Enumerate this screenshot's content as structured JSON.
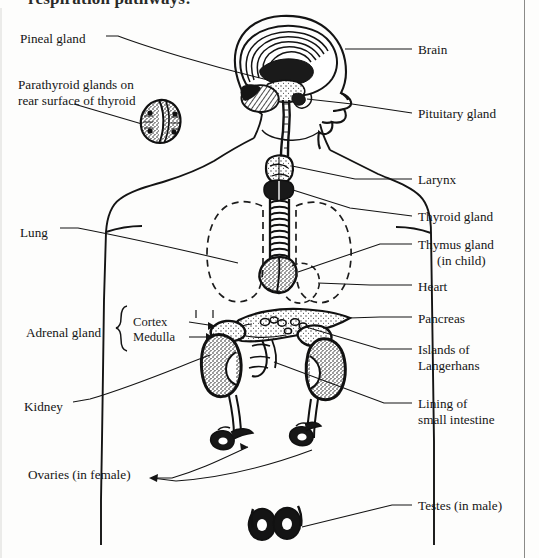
{
  "page": {
    "heading_clipped": "respiration pathways:",
    "background": "#fdfdfc",
    "ink": "#151515",
    "width": 539,
    "height": 558
  },
  "labels": {
    "left": [
      {
        "id": "pineal-gland",
        "text": "Pineal gland",
        "x": 20,
        "y": 31
      },
      {
        "id": "parathyroid-glands",
        "text": "Parathyroid glands on",
        "text2": "rear surface of thyroid",
        "x": 18,
        "y": 77
      },
      {
        "id": "lung",
        "text": "Lung",
        "x": 20,
        "y": 225
      },
      {
        "id": "adrenal-gland",
        "text": "Adrenal gland",
        "x": 26,
        "y": 325
      },
      {
        "id": "kidney",
        "text": "Kidney",
        "x": 24,
        "y": 399
      },
      {
        "id": "ovaries-in-female",
        "text": "Ovaries (in female)",
        "x": 28,
        "y": 474
      }
    ],
    "brace": [
      {
        "id": "cortex",
        "text": "Cortex",
        "x": 133,
        "y": 317
      },
      {
        "id": "medulla",
        "text": "Medulla",
        "x": 133,
        "y": 332
      }
    ],
    "right": [
      {
        "id": "brain",
        "text": "Brain",
        "x": 418,
        "y": 48
      },
      {
        "id": "pituitary-gland",
        "text": "Pituitary gland",
        "x": 418,
        "y": 112
      },
      {
        "id": "larynx",
        "text": "Larynx",
        "x": 418,
        "y": 176
      },
      {
        "id": "thyroid-gland",
        "text": "Thyroid gland",
        "x": 418,
        "y": 214
      },
      {
        "id": "thymus-gland",
        "text": "Thymus gland",
        "text2": "(in child)",
        "x": 418,
        "y": 241,
        "indent2": true
      },
      {
        "id": "heart",
        "text": "Heart",
        "x": 418,
        "y": 283
      },
      {
        "id": "pancreas",
        "text": "Pancreas",
        "x": 418,
        "y": 315
      },
      {
        "id": "islands-of-langerhans",
        "text": "Islands of",
        "text2": "Langerhans",
        "x": 418,
        "y": 346
      },
      {
        "id": "lining-of-small-intestine",
        "text": "Lining of",
        "text2": "small intestine",
        "x": 418,
        "y": 401
      },
      {
        "id": "testes-in-male",
        "text": "Testes (in male)",
        "x": 418,
        "y": 503
      }
    ]
  },
  "anatomy": {
    "organs": [
      "brain",
      "pituitary-gland",
      "larynx",
      "trachea",
      "thyroid-gland",
      "thymus-gland",
      "heart-outline",
      "lung-outline-left",
      "lung-outline-right",
      "pancreas",
      "adrenal-gland-left",
      "adrenal-gland-right",
      "kidney-left",
      "kidney-right",
      "ureter-left",
      "ureter-right",
      "ovary-left",
      "ovary-right",
      "testis-left",
      "testis-right",
      "parathyroid-inset",
      "body-outline",
      "head-profile"
    ]
  }
}
